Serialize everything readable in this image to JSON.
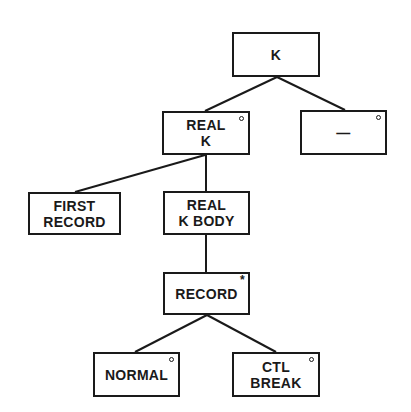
{
  "diagram": {
    "type": "jackson-structure-tree",
    "nodes": [
      {
        "id": "k",
        "lines": [
          "K"
        ],
        "marker": "",
        "box": [
          232,
          32,
          88,
          45
        ]
      },
      {
        "id": "real-k",
        "lines": [
          "REAL",
          "K"
        ],
        "marker": "o",
        "box": [
          162,
          111,
          88,
          44
        ]
      },
      {
        "id": "dash",
        "lines": [
          "—"
        ],
        "marker": "o",
        "box": [
          300,
          110,
          87,
          45
        ]
      },
      {
        "id": "first-record",
        "lines": [
          "FIRST",
          "RECORD"
        ],
        "marker": "",
        "box": [
          28,
          192,
          93,
          43
        ]
      },
      {
        "id": "real-k-body",
        "lines": [
          "REAL",
          "K BODY"
        ],
        "marker": "",
        "box": [
          163,
          191,
          87,
          44
        ]
      },
      {
        "id": "record",
        "lines": [
          "RECORD"
        ],
        "marker": "*",
        "box": [
          163,
          272,
          87,
          43
        ]
      },
      {
        "id": "normal",
        "lines": [
          "NORMAL"
        ],
        "marker": "o",
        "box": [
          93,
          352,
          87,
          45
        ]
      },
      {
        "id": "ctl-break",
        "lines": [
          "CTL",
          "BREAK"
        ],
        "marker": "o",
        "box": [
          232,
          352,
          88,
          45
        ]
      }
    ],
    "edges": [
      {
        "from": "k",
        "to": "real-k",
        "coords": [
          277,
          77,
          205,
          111
        ]
      },
      {
        "from": "k",
        "to": "dash",
        "coords": [
          277,
          77,
          345,
          110
        ]
      },
      {
        "from": "real-k",
        "to": "first-record",
        "coords": [
          205,
          155,
          75,
          192
        ]
      },
      {
        "from": "real-k",
        "to": "real-k-body",
        "coords": [
          206,
          155,
          206,
          191
        ]
      },
      {
        "from": "real-k-body",
        "to": "record",
        "coords": [
          206,
          235,
          206,
          272
        ]
      },
      {
        "from": "record",
        "to": "normal",
        "coords": [
          207,
          315,
          135,
          352
        ]
      },
      {
        "from": "record",
        "to": "ctl-break",
        "coords": [
          207,
          315,
          276,
          352
        ]
      }
    ],
    "legend": {
      "o": "selection (choice)",
      "*": "iteration"
    }
  }
}
